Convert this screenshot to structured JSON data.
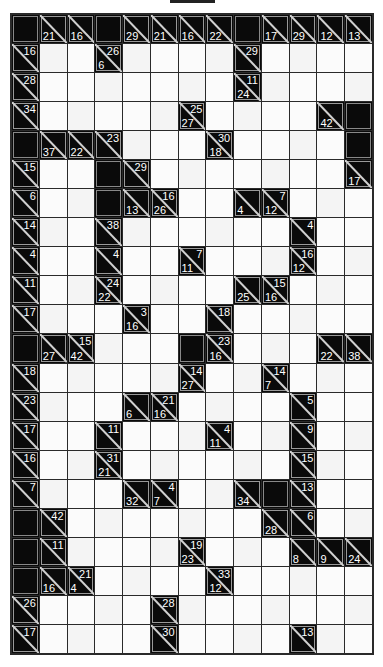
{
  "puzzle": {
    "type": "kakuro",
    "columns": 13,
    "rows": 22,
    "legend": {
      "W": "white entry cell",
      "B": "blank black cell",
      "clue": "[across, down]"
    },
    "grid": [
      [
        "B",
        [
          null,
          21
        ],
        [
          null,
          16
        ],
        "B",
        [
          null,
          29
        ],
        [
          null,
          21
        ],
        [
          null,
          16
        ],
        [
          null,
          22
        ],
        "B",
        [
          null,
          17
        ],
        [
          null,
          29
        ],
        [
          null,
          12
        ],
        [
          null,
          13
        ]
      ],
      [
        [
          16,
          null
        ],
        "W",
        "W",
        [
          26,
          6
        ],
        "W",
        "W",
        "W",
        "W",
        [
          29,
          null
        ],
        "W",
        "W",
        "W",
        "W"
      ],
      [
        [
          28,
          null
        ],
        "W",
        "W",
        "W",
        "W",
        "W",
        "W",
        "W",
        [
          11,
          24
        ],
        "W",
        "W",
        "W",
        "W"
      ],
      [
        [
          34,
          null
        ],
        "W",
        "W",
        "W",
        "W",
        "W",
        [
          25,
          27
        ],
        "W",
        "W",
        "W",
        "W",
        [
          null,
          42
        ],
        "B"
      ],
      [
        "B",
        [
          null,
          37
        ],
        [
          null,
          22
        ],
        [
          23,
          null
        ],
        "W",
        "W",
        "W",
        [
          30,
          18
        ],
        "W",
        "W",
        "W",
        "W",
        "B"
      ],
      [
        [
          15,
          null
        ],
        "W",
        "W",
        "B",
        [
          29,
          null
        ],
        "W",
        "W",
        "W",
        "W",
        "W",
        "W",
        "W",
        [
          null,
          17
        ]
      ],
      [
        [
          6,
          null
        ],
        "W",
        "W",
        "B",
        [
          null,
          13
        ],
        [
          16,
          26
        ],
        "W",
        "W",
        [
          null,
          4
        ],
        [
          7,
          12
        ],
        "W",
        "W",
        "W"
      ],
      [
        [
          14,
          null
        ],
        "W",
        "W",
        [
          38,
          null
        ],
        "W",
        "W",
        "W",
        "W",
        "W",
        "W",
        [
          4,
          null
        ],
        "W",
        "W"
      ],
      [
        [
          4,
          null
        ],
        "W",
        "W",
        [
          4,
          null
        ],
        "W",
        "W",
        [
          7,
          11
        ],
        "W",
        "W",
        "W",
        [
          16,
          12
        ],
        "W",
        "W"
      ],
      [
        [
          11,
          null
        ],
        "W",
        "W",
        [
          24,
          22
        ],
        "W",
        "W",
        "W",
        "W",
        [
          null,
          25
        ],
        [
          15,
          16
        ],
        "W",
        "W",
        "W"
      ],
      [
        [
          17,
          null
        ],
        "W",
        "W",
        "W",
        [
          3,
          16
        ],
        "W",
        "W",
        [
          18,
          null
        ],
        "W",
        "W",
        "W",
        "W",
        "W"
      ],
      [
        "B",
        [
          null,
          27
        ],
        [
          15,
          42
        ],
        "W",
        "W",
        "W",
        "B",
        [
          23,
          16
        ],
        "W",
        "W",
        "W",
        [
          null,
          22
        ],
        [
          null,
          38
        ]
      ],
      [
        [
          18,
          null
        ],
        "W",
        "W",
        "W",
        "W",
        "W",
        [
          14,
          27
        ],
        "W",
        "W",
        [
          14,
          7
        ],
        "W",
        "W",
        "W"
      ],
      [
        [
          23,
          null
        ],
        "W",
        "W",
        "W",
        [
          null,
          6
        ],
        [
          21,
          16
        ],
        "W",
        "W",
        "W",
        "W",
        [
          5,
          null
        ],
        "W",
        "W"
      ],
      [
        [
          17,
          null
        ],
        "W",
        "W",
        [
          11,
          null
        ],
        "W",
        "W",
        "W",
        [
          4,
          11
        ],
        "W",
        "W",
        [
          9,
          null
        ],
        "W",
        "W"
      ],
      [
        [
          16,
          null
        ],
        "W",
        "W",
        [
          31,
          21
        ],
        "W",
        "W",
        "W",
        "W",
        "W",
        "W",
        [
          15,
          null
        ],
        "W",
        "W"
      ],
      [
        [
          7,
          null
        ],
        "W",
        "W",
        "W",
        [
          null,
          32
        ],
        [
          4,
          7
        ],
        "W",
        "W",
        [
          null,
          34
        ],
        "B",
        [
          13,
          null
        ],
        "W",
        "W"
      ],
      [
        "B",
        [
          42,
          null
        ],
        "W",
        "W",
        "W",
        "W",
        "W",
        "W",
        "W",
        [
          null,
          28
        ],
        [
          6,
          null
        ],
        "W",
        "W"
      ],
      [
        "B",
        [
          11,
          null
        ],
        "W",
        "W",
        "W",
        "W",
        [
          19,
          23
        ],
        "W",
        "W",
        "W",
        [
          null,
          8
        ],
        [
          null,
          9
        ],
        [
          null,
          24
        ]
      ],
      [
        "B",
        [
          null,
          16
        ],
        [
          21,
          4
        ],
        "W",
        "W",
        "W",
        "W",
        [
          33,
          12
        ],
        "W",
        "W",
        "W",
        "W",
        "W"
      ],
      [
        [
          26,
          null
        ],
        "W",
        "W",
        "W",
        "W",
        [
          28,
          null
        ],
        "W",
        "W",
        "W",
        "W",
        "W",
        "W",
        "W"
      ],
      [
        [
          17,
          null
        ],
        "W",
        "W",
        "W",
        "W",
        [
          30,
          null
        ],
        "W",
        "W",
        "W",
        "W",
        [
          13,
          null
        ],
        "W",
        "W"
      ]
    ]
  },
  "colors": {
    "clue_bg": "#0a0a0a",
    "clue_text": "#ffffff",
    "entry_bg": "#fbfbfb",
    "grid_line": "#2a2a2a"
  }
}
